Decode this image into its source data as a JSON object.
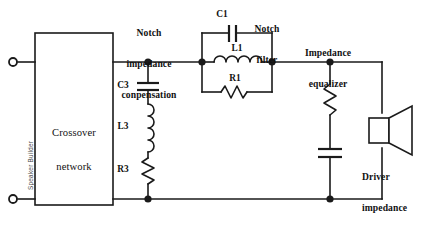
{
  "diagram": {
    "background_color": "#ffffff",
    "line_color": "#1a1a1a"
  },
  "watermark": {
    "text": "Speaker Builder"
  },
  "blocks": {
    "crossover": {
      "line1": "Crossover",
      "line2": "network"
    }
  },
  "sections": {
    "notch_compensation": {
      "line1": "Notch",
      "line2": "impedance",
      "line3": "conpensation"
    },
    "notch_filter": {
      "line1": "Notch",
      "line2": "filter"
    },
    "impedance_equalizer": {
      "line1": "Impedance",
      "line2": "equalizer"
    },
    "driver": {
      "line1": "Driver",
      "line2": "impedance",
      "line3": "= R2"
    }
  },
  "components": {
    "c1": {
      "label": "C1",
      "type": "capacitor"
    },
    "l1": {
      "label": "L1",
      "type": "inductor"
    },
    "r1": {
      "label": "R1",
      "type": "resistor"
    },
    "c3": {
      "label": "C3",
      "type": "capacitor"
    },
    "l3": {
      "label": "L3",
      "type": "inductor"
    },
    "r3": {
      "label": "R3",
      "type": "resistor"
    },
    "zobel_resistor": {
      "label": "",
      "type": "resistor"
    },
    "zobel_capacitor": {
      "label": "",
      "type": "capacitor"
    }
  },
  "terminals": {
    "input_positive": "",
    "input_negative": ""
  }
}
